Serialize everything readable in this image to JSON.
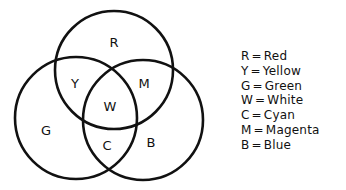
{
  "diagram": {
    "type": "venn",
    "circles": [
      {
        "id": "red",
        "label": "R",
        "cx": 114,
        "cy": 70,
        "r": 59
      },
      {
        "id": "green",
        "label": "G",
        "cx": 76,
        "cy": 118,
        "r": 61
      },
      {
        "id": "blue",
        "label": "B",
        "cx": 143,
        "cy": 120,
        "r": 60
      }
    ],
    "stroke_color": "#111111",
    "regions": [
      {
        "key": "R",
        "x": 114,
        "y": 42
      },
      {
        "key": "Y",
        "x": 75,
        "y": 83
      },
      {
        "key": "M",
        "x": 144,
        "y": 83
      },
      {
        "key": "W",
        "x": 110,
        "y": 106
      },
      {
        "key": "G",
        "x": 46,
        "y": 130
      },
      {
        "key": "C",
        "x": 107,
        "y": 145
      },
      {
        "key": "B",
        "x": 151,
        "y": 142
      }
    ]
  },
  "legend": {
    "items": [
      {
        "key": "R",
        "eq": "=",
        "name": "Red"
      },
      {
        "key": "Y",
        "eq": "=",
        "name": "Yellow"
      },
      {
        "key": "G",
        "eq": "=",
        "name": "Green"
      },
      {
        "key": "W",
        "eq": "=",
        "name": "White"
      },
      {
        "key": "C",
        "eq": "=",
        "name": "Cyan"
      },
      {
        "key": "M",
        "eq": "=",
        "name": "Magenta"
      },
      {
        "key": "B",
        "eq": "=",
        "name": "Blue"
      }
    ]
  }
}
